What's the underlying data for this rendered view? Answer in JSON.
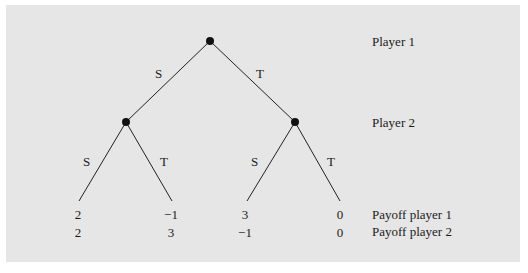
{
  "tree": {
    "players": {
      "p1": "Player 1",
      "p2": "Player 2"
    },
    "root_moves": {
      "left": "S",
      "right": "T"
    },
    "left_node_moves": {
      "left": "S",
      "right": "T"
    },
    "right_node_moves": {
      "left": "S",
      "right": "T"
    },
    "payoff_labels": {
      "p1": "Payoff player 1",
      "p2": "Payoff player 2"
    },
    "leaves": [
      {
        "p1": "2",
        "p2": "2"
      },
      {
        "p1": "−1",
        "p2": "3"
      },
      {
        "p1": "3",
        "p2": "−1"
      },
      {
        "p1": "0",
        "p2": "0"
      }
    ]
  }
}
